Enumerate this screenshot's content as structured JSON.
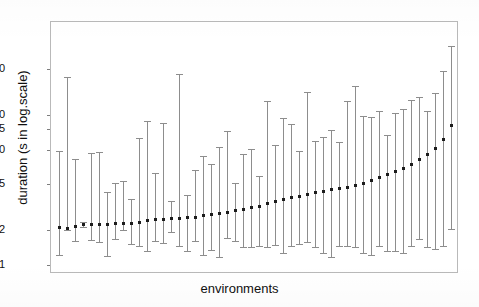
{
  "chart_data": {
    "type": "scatter",
    "title": "",
    "subtitle": "",
    "xlabel": "environments",
    "ylabel": "duration (s in log.scale)",
    "yscale": "log",
    "grid": false,
    "legend": null,
    "ytick_labels": [
      "0.1",
      "0.2",
      "0.5",
      "1.0",
      "1.5",
      "2.0",
      "5.0"
    ],
    "ytick_values": [
      0.1,
      0.2,
      0.5,
      1.0,
      1.5,
      2.0,
      5.0
    ],
    "ylim": [
      0.085,
      13.0
    ],
    "xlim": [
      0,
      51
    ],
    "xtick_labels": [],
    "marker": "square",
    "marker_color": "#1c1c1c",
    "errorbar_color": "#8d8d8d",
    "series": [
      {
        "name": "duration",
        "x": [
          1,
          2,
          3,
          4,
          5,
          6,
          7,
          8,
          9,
          10,
          11,
          12,
          13,
          14,
          15,
          16,
          17,
          18,
          19,
          20,
          21,
          22,
          23,
          24,
          25,
          26,
          27,
          28,
          29,
          30,
          31,
          32,
          33,
          34,
          35,
          36,
          37,
          38,
          39,
          40,
          41,
          42,
          43,
          44,
          45,
          46,
          47,
          48,
          49,
          50
        ],
        "values": [
          0.215,
          0.212,
          0.218,
          0.228,
          0.228,
          0.228,
          0.228,
          0.232,
          0.232,
          0.233,
          0.24,
          0.248,
          0.25,
          0.252,
          0.255,
          0.258,
          0.262,
          0.265,
          0.272,
          0.278,
          0.285,
          0.292,
          0.3,
          0.31,
          0.32,
          0.33,
          0.345,
          0.36,
          0.375,
          0.39,
          0.4,
          0.415,
          0.43,
          0.44,
          0.455,
          0.47,
          0.48,
          0.495,
          0.52,
          0.545,
          0.58,
          0.62,
          0.66,
          0.7,
          0.76,
          0.83,
          0.93,
          1.05,
          1.25,
          1.65
        ],
        "lower": [
          0.124,
          0.205,
          0.165,
          0.218,
          0.168,
          0.16,
          0.122,
          0.172,
          0.205,
          0.155,
          0.15,
          0.135,
          0.163,
          0.157,
          0.197,
          0.148,
          0.135,
          0.165,
          0.125,
          0.138,
          0.12,
          0.175,
          0.165,
          0.145,
          0.147,
          0.15,
          0.145,
          0.152,
          0.13,
          0.15,
          0.155,
          0.16,
          0.145,
          0.128,
          0.12,
          0.15,
          0.15,
          0.145,
          0.13,
          0.125,
          0.15,
          0.135,
          0.135,
          0.13,
          0.15,
          0.17,
          0.145,
          0.14,
          0.15,
          0.21
        ],
        "upper": [
          1.0,
          4.3,
          0.85,
          0.24,
          0.96,
          0.975,
          0.44,
          0.52,
          0.54,
          0.38,
          1.28,
          1.8,
          0.64,
          1.74,
          0.365,
          4.6,
          0.41,
          0.68,
          0.9,
          0.76,
          1.08,
          1.48,
          0.52,
          0.935,
          1.03,
          0.6,
          2.7,
          1.12,
          1.9,
          1.7,
          1.0,
          3.2,
          1.22,
          1.3,
          1.5,
          1.18,
          2.7,
          3.6,
          2.0,
          1.95,
          2.2,
          1.35,
          2.1,
          2.3,
          2.75,
          2.9,
          2.2,
          3.15,
          4.9,
          8.0
        ]
      }
    ]
  },
  "axis": {
    "y_title": "duration (s in log.scale)",
    "x_title": "environments"
  }
}
